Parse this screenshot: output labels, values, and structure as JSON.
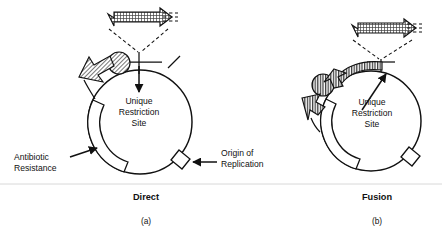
{
  "figure": {
    "title": "",
    "panels": [
      {
        "id": "panel-a",
        "caption_bold": "Direct",
        "caption_letter": "(a)",
        "labels": {
          "restriction_site": [
            "Unique",
            "Restriction",
            "Site"
          ],
          "antibiotic_resistance": [
            "Antibiotic",
            "Resistance"
          ],
          "origin_of_replication": [
            "Origin of",
            "Replication"
          ]
        },
        "elements": {
          "insert_cassette": "hatched-arrow-cassette",
          "expression_arrow": "hatched-arrow-left",
          "protein_domain": "hatched-circle",
          "restriction_tick": "tick-mark",
          "antibiotic_band": "arc-band",
          "origin_box": "small-box"
        }
      },
      {
        "id": "panel-b",
        "caption_bold": "Fusion",
        "caption_letter": "(b)",
        "labels": {
          "restriction_site": [
            "Unique",
            "Restriction",
            "Site"
          ]
        },
        "elements": {
          "insert_cassette": "hatched-arrow-cassette",
          "fusion_band": "hatched-fused-band",
          "expression_arrow": "hatched-arrow-down",
          "protein_domain": "hatched-circle",
          "antibiotic_band": "arc-band",
          "origin_box": "small-box"
        }
      }
    ],
    "colors": {
      "ink": "#111111",
      "paper": "#ffffff",
      "hatch": "#555555",
      "divider": "#d8d8d8"
    }
  }
}
